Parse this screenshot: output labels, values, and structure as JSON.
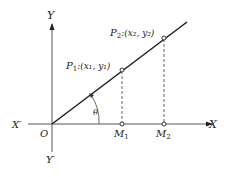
{
  "diagram": {
    "axes": {
      "y_label": "Y",
      "y_neg_label": "Y′",
      "x_label": "X",
      "x_neg_label": "X′",
      "origin_label": "O"
    },
    "points": {
      "p1_label": "P",
      "p1_sub": "1",
      "p1_coords": ":(x₁, y₁)",
      "p2_label": "P",
      "p2_sub": "2",
      "p2_coords": ":(x₂, y₂)",
      "m1_label": "M",
      "m1_sub": "1",
      "m2_label": "M",
      "m2_sub": "2"
    },
    "angle_label": "θ",
    "colors": {
      "line": "#1a1a1a",
      "dashed": "#555555"
    }
  }
}
